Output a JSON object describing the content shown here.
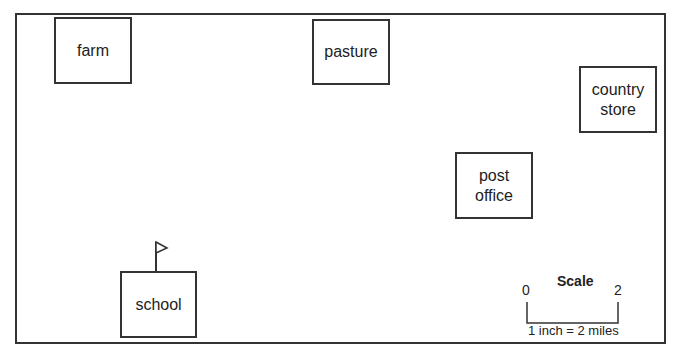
{
  "map": {
    "buildings": [
      {
        "id": "farm",
        "label": "farm"
      },
      {
        "id": "pasture",
        "label": "pasture"
      },
      {
        "id": "country-store",
        "label": "country store"
      },
      {
        "id": "post-office",
        "label": "post office"
      },
      {
        "id": "school",
        "label": "school"
      }
    ],
    "scale": {
      "title": "Scale",
      "start": "0",
      "end": "2",
      "caption": "1 inch = 2 miles"
    }
  }
}
